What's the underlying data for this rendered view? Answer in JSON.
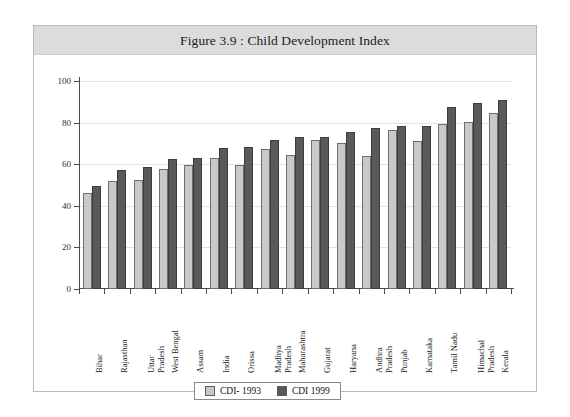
{
  "figure": {
    "title": "Figure 3.9 : Child Development Index"
  },
  "legend": {
    "items": [
      {
        "label": "CDI- 1993",
        "color": "#c9c9c9"
      },
      {
        "label": "CDI 1999",
        "color": "#5a5a5a"
      }
    ]
  },
  "chart_data": {
    "type": "bar",
    "title": "Figure 3.9 : Child Development Index",
    "xlabel": "",
    "ylabel": "",
    "ylim": [
      0,
      100
    ],
    "yticks": [
      0,
      20,
      40,
      60,
      80,
      100
    ],
    "grid": true,
    "legend_position": "bottom-center",
    "categories": [
      "Bihar",
      "Rajasthan",
      "Uttar Pradesh",
      "West Bengal",
      "Assam",
      "India",
      "Orissa",
      "Madhya Pradesh",
      "Maharashtra",
      "Gujarat",
      "Haryana",
      "Andhra Pradesh",
      "Punjab",
      "Karnataka",
      "Tamil Nadu",
      "Himachal Pradesh",
      "Kerala"
    ],
    "series": [
      {
        "name": "CDI- 1993",
        "color": "#c9c9c9",
        "values": [
          46,
          52,
          52.5,
          57.5,
          59.5,
          63,
          59.5,
          67.5,
          64.5,
          71.5,
          70,
          64,
          76.5,
          71,
          79.5,
          80.5,
          84.5
        ]
      },
      {
        "name": "CDI 1999",
        "color": "#5a5a5a",
        "values": [
          49.5,
          57,
          58.5,
          62.5,
          63,
          68,
          68.5,
          71.5,
          73,
          73,
          75.5,
          77.5,
          78.5,
          78.5,
          87.5,
          89.5,
          91
        ]
      }
    ]
  }
}
